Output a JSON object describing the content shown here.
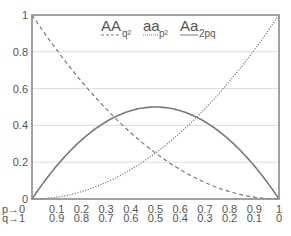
{
  "chart_data": {
    "type": "line",
    "title": "",
    "xlabel": "",
    "ylabel": "",
    "xlim": [
      0,
      1
    ],
    "ylim": [
      0,
      1
    ],
    "grid": true,
    "legend_position": "top-center-inside",
    "x": [
      0,
      0.1,
      0.2,
      0.3,
      0.4,
      0.5,
      0.6,
      0.7,
      0.8,
      0.9,
      1
    ],
    "x_tick_labels_p": [
      "p→0",
      "0.1",
      "0.2",
      "0.3",
      "0.4",
      "0.5",
      "0.6",
      "0.7",
      "0.8",
      "0.9",
      "1"
    ],
    "x_tick_labels_q": [
      "q→1",
      "0.9",
      "0.8",
      "0.7",
      "0.6",
      "0.5",
      "0.4",
      "0.3",
      "0.2",
      "0.1",
      "0"
    ],
    "y_ticks": [
      0,
      0.2,
      0.4,
      0.6,
      0.8,
      1
    ],
    "y_tick_labels": [
      "0",
      "0.2",
      "0.4",
      "0.6",
      "0.8",
      "1"
    ],
    "series": [
      {
        "name": "AA",
        "subscript": "q²",
        "style": "dashed",
        "values": [
          1,
          0.81,
          0.64,
          0.49,
          0.36,
          0.25,
          0.16,
          0.09,
          0.04,
          0.01,
          0
        ]
      },
      {
        "name": "aa",
        "subscript": "p²",
        "style": "dotted",
        "values": [
          0,
          0.01,
          0.04,
          0.09,
          0.16,
          0.25,
          0.36,
          0.49,
          0.64,
          0.81,
          1
        ]
      },
      {
        "name": "Aa",
        "subscript": "2pq",
        "style": "solid",
        "values": [
          0,
          0.18,
          0.32,
          0.42,
          0.48,
          0.5,
          0.48,
          0.42,
          0.32,
          0.18,
          0
        ]
      }
    ]
  },
  "colors": {
    "frame": "#8a8a8a",
    "grid": "#dddddd",
    "line": "#7a7a7a",
    "text": "#555555"
  },
  "legend": {
    "items": [
      {
        "label": "AA",
        "sub": "q²"
      },
      {
        "label": "aa",
        "sub": "p²"
      },
      {
        "label": "Aa",
        "sub": "2pq"
      }
    ]
  }
}
